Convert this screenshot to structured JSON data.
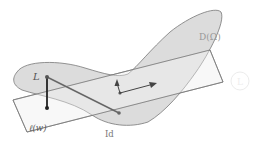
{
  "diagram": {
    "region_label": "D(Ω)",
    "line_label": "ℓ(w)",
    "point_L_label": "L",
    "point_id_label": "Id",
    "ghost_marker_label": "L",
    "colors": {
      "region_fill": "#d8d8d8",
      "region_stroke": "#777777",
      "band_fill": "#f3f3f3",
      "band_stroke": "#777777",
      "segment": "#666666",
      "vertical_segment": "#222222",
      "arrow": "#444444",
      "label": "#555555"
    }
  }
}
